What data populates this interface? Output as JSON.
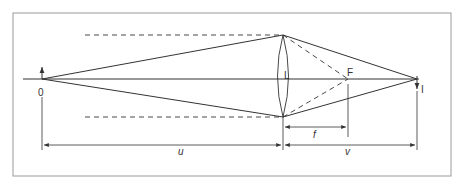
{
  "diagram": {
    "colors": {
      "line": "#333333",
      "frame": "#9a9a9a",
      "background": "#ffffff"
    },
    "labels": {
      "object": "0",
      "lens": "L",
      "focus": "F",
      "image": "I",
      "focal_length": "f",
      "object_distance": "u",
      "image_distance": "v"
    }
  }
}
